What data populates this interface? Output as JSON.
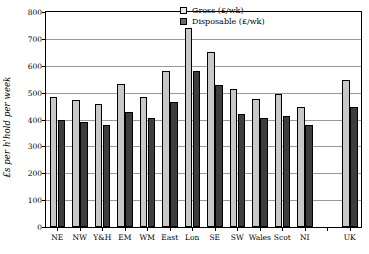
{
  "chart_data": {
    "type": "bar",
    "title": "",
    "xlabel": "",
    "ylabel": "£s per h'hold per week",
    "ylim": [
      0,
      800
    ],
    "ytick_step": 100,
    "grid": true,
    "legend_position": "top-right",
    "categories": [
      "NE",
      "NW",
      "Y&H",
      "EM",
      "WM",
      "East",
      "Lon",
      "SE",
      "SW",
      "Wales",
      "Scot",
      "NI",
      "",
      "UK"
    ],
    "series": [
      {
        "name": "Gross (£/wk)",
        "color": "#c8c8c8",
        "values": [
          482,
          472,
          456,
          534,
          484,
          580,
          740,
          650,
          514,
          478,
          495,
          445,
          null,
          548
        ]
      },
      {
        "name": "Disposable (£/wk)",
        "color": "#3d3d3d",
        "values": [
          400,
          392,
          380,
          428,
          404,
          464,
          580,
          530,
          422,
          404,
          414,
          378,
          null,
          447
        ]
      }
    ],
    "ytick_labels": [
      "0",
      "100",
      "200",
      "300",
      "400",
      "500",
      "600",
      "700",
      "800"
    ],
    "legend": [
      {
        "label": "Gross (£/wk)",
        "swatch": "gross"
      },
      {
        "label": "Disposable (£/wk)",
        "swatch": "disp"
      }
    ]
  }
}
